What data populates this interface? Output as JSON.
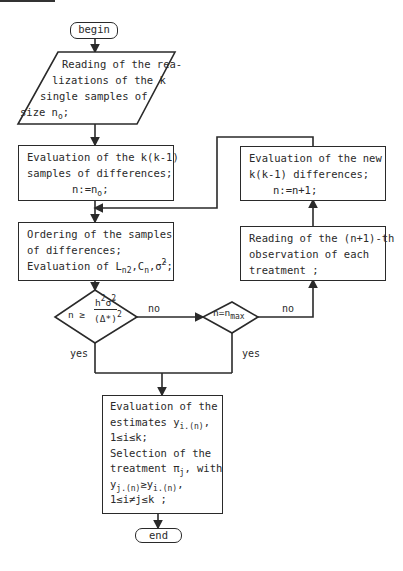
{
  "flowchart": {
    "begin": "begin",
    "end": "end",
    "input_block": {
      "lines": [
        "Reading of the rea-",
        "lizations of the k",
        "single samples of",
        "size n"
      ],
      "subscript_last": "o",
      "suffix_last": ";"
    },
    "eval_differences": {
      "line1": "Evaluation of the k(k-1)",
      "line2": "samples of differences;",
      "line3_pre": "n:=n",
      "line3_sub": "o",
      "line3_post": ";"
    },
    "ordering": {
      "line1": "Ordering of the samples",
      "line2": "of differences;",
      "line3_pre": "Evaluation of L",
      "L_sub": "n2",
      "C": ",C",
      "C_sub": "n",
      "sigma_text": ",σ̂",
      "sigma_sup": "2",
      "line3_post": ";"
    },
    "decision1": {
      "lhs": "n ≥",
      "numerator_h": "h",
      "numerator_sup": "2",
      "numerator_sigma": "σ̂",
      "numerator_sup2": "2",
      "denominator": "(Δ*)",
      "denominator_sup": "2",
      "yes_label": "yes",
      "no_label": "no"
    },
    "decision2": {
      "text": "n=n",
      "sub": "max",
      "yes_label": "yes",
      "no_label": "no"
    },
    "read_next": {
      "line1": "Reading of the (n+1)-th",
      "line2": "observation of each",
      "line3": "treatment ;"
    },
    "eval_new": {
      "line1": "Evaluation of the new",
      "line2": "k(k-1) differences;",
      "line3": "n:=n+1;"
    },
    "final": {
      "line1": "Evaluation of the",
      "line2_pre": "estimates y",
      "line2_sub": "i.(n)",
      "line2_post": ",",
      "line3": "1≤i≤k;",
      "line4": "Selection of the",
      "line5_pre": "treatment π",
      "line5_sub": "j",
      "line5_post": ", with",
      "line6_y1": "y",
      "line6_sub1": "j.(n)",
      "line6_op": "≥y",
      "line6_sub2": "i.(n)",
      "line6_post": ",",
      "line7": "1≤i≠j≤k ;"
    }
  }
}
